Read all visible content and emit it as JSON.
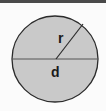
{
  "diagram": {
    "labels": {
      "radius": "r",
      "diameter": "d"
    },
    "colors": {
      "fill": "#c9c9c9",
      "stroke": "#2b2b2b",
      "border": "#4a4a4a"
    }
  }
}
